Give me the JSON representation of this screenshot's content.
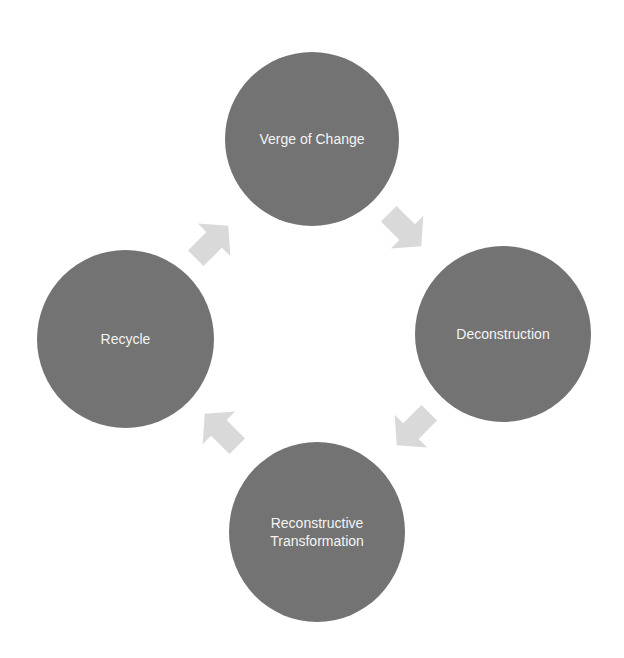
{
  "diagram": {
    "type": "cycle",
    "colors": {
      "node_fill": "#737373",
      "node_text": "#f4f4f4",
      "arrow_fill": "#d9d9d9",
      "background": "#ffffff"
    },
    "nodes": [
      {
        "id": "top",
        "label": "Verge of Change"
      },
      {
        "id": "right",
        "label": "Deconstruction"
      },
      {
        "id": "bottom",
        "label": "Reconstructive\nTransformation"
      },
      {
        "id": "left",
        "label": "Recycle"
      }
    ],
    "arrows": [
      {
        "from": "top",
        "to": "right",
        "direction": "down-right"
      },
      {
        "from": "right",
        "to": "bottom",
        "direction": "down-left"
      },
      {
        "from": "bottom",
        "to": "left",
        "direction": "up-left"
      },
      {
        "from": "left",
        "to": "top",
        "direction": "up-right"
      }
    ]
  }
}
